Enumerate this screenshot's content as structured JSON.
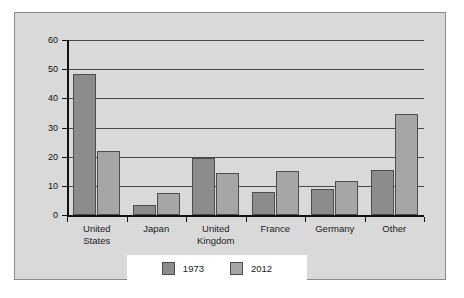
{
  "chart_data": {
    "type": "bar",
    "title": "",
    "subtitle": "",
    "xlabel": "",
    "ylabel": "",
    "ylim": [
      0,
      60
    ],
    "yticks": [
      0,
      10,
      20,
      30,
      40,
      50,
      60
    ],
    "ytick_labels": [
      "0",
      "10",
      "20",
      "30",
      "40",
      "50",
      "60"
    ],
    "grid": true,
    "grid_axis": "y",
    "legend_position": "bottom",
    "categories": [
      "United States",
      "Japan",
      "United Kingdom",
      "France",
      "Germany",
      "Other"
    ],
    "category_label_lines": [
      [
        "United",
        "States"
      ],
      [
        "Japan"
      ],
      [
        "United",
        "Kingdom"
      ],
      [
        "France"
      ],
      [
        "Germany"
      ],
      [
        "Other"
      ]
    ],
    "series": [
      {
        "name": "1973",
        "color": "#8c8c8c",
        "values": [
          48.5,
          3.5,
          19.5,
          8,
          9,
          15.5
        ]
      },
      {
        "name": "2012",
        "color": "#a6a6a6",
        "values": [
          22,
          7.5,
          14.5,
          15,
          11.5,
          34.5
        ]
      }
    ]
  },
  "legend": {
    "items": [
      {
        "label": "1973",
        "color": "#8c8c8c"
      },
      {
        "label": "2012",
        "color": "#a6a6a6"
      }
    ]
  },
  "colors": {
    "figure_background": "#d9d9d9",
    "plot_background": "#d9d9d9",
    "axis": "#111111",
    "gridline": "#4a4a4a",
    "bar_border": "#4d4d4d",
    "legend_background": "#ffffff",
    "text": "#1a1a1a"
  }
}
